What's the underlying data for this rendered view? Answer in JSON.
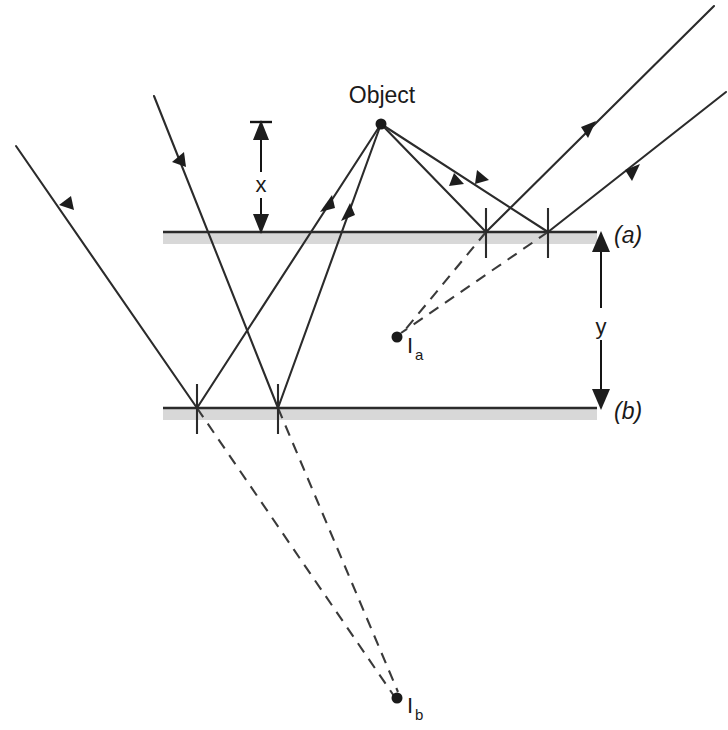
{
  "figure": {
    "title_label": "Object",
    "background_color": "#ffffff",
    "ray_color": "#2b2b2b",
    "virtual_ray_color": "#3a3a3a",
    "mirror_color": "#2b2b2b",
    "mirror_shade_color": "#c9c9c9"
  },
  "labels": {
    "object": "Object",
    "distance_x": "x",
    "distance_y": "y",
    "mirror_a": "(a)",
    "mirror_b": "(b)",
    "image_a_main": "I",
    "image_a_sub": "a",
    "image_b_main": "I",
    "image_b_sub": "b"
  },
  "points": {
    "object": {
      "x": 381,
      "y": 124,
      "label": "Object"
    },
    "image_a": {
      "x": 397,
      "y": 337,
      "label": "Ia"
    },
    "image_b": {
      "x": 397,
      "y": 698,
      "label": "Ib"
    }
  },
  "mirrors": [
    {
      "id": "a",
      "label": "(a)",
      "y": 232,
      "x_start": 163,
      "x_end": 597
    },
    {
      "id": "b",
      "label": "(b)",
      "y": 408,
      "x_start": 163,
      "x_end": 597
    }
  ],
  "reflection_points": [
    {
      "mirror": "a",
      "x": 486,
      "y": 232
    },
    {
      "mirror": "a",
      "x": 548,
      "y": 232
    },
    {
      "mirror": "b",
      "x": 197,
      "y": 408
    },
    {
      "mirror": "b",
      "x": 278,
      "y": 408
    }
  ],
  "dimensions": [
    {
      "id": "x",
      "label": "x",
      "orientation": "vertical",
      "axis_x": 261,
      "from_y": 124,
      "to_y": 232,
      "label_x": 261,
      "label_y": 186
    },
    {
      "id": "y",
      "label": "y",
      "orientation": "vertical",
      "axis_x": 601,
      "from_y": 233,
      "to_y": 408,
      "label_x": 601,
      "label_y": 327
    }
  ],
  "rays": {
    "incident_to_mirror_a": [
      {
        "from": [
          381,
          124
        ],
        "to": [
          486,
          232
        ],
        "arrow_at": [
          443,
          180
        ]
      },
      {
        "from": [
          381,
          124
        ],
        "to": [
          548,
          232
        ],
        "arrow_at": [
          472,
          177
        ]
      }
    ],
    "reflected_from_mirror_a": [
      {
        "from": [
          486,
          232
        ],
        "to": [
          712,
          8
        ],
        "arrow_at": [
          586,
          130
        ]
      },
      {
        "from": [
          548,
          232
        ],
        "to": [
          722,
          96
        ],
        "arrow_at": [
          632,
          170
        ]
      }
    ],
    "incident_to_mirror_b": [
      {
        "from": [
          381,
          124
        ],
        "to": [
          197,
          408
        ],
        "arrow_at": [
          327,
          206
        ]
      },
      {
        "from": [
          381,
          124
        ],
        "to": [
          278,
          408
        ],
        "arrow_at": [
          348,
          214
        ]
      }
    ],
    "reflected_from_mirror_b": [
      {
        "from": [
          197,
          408
        ],
        "to": [
          18,
          148
        ],
        "arrow_at": [
          66,
          212
        ]
      },
      {
        "from": [
          278,
          408
        ],
        "to": [
          155,
          98
        ],
        "arrow_at": [
          178,
          168
        ]
      }
    ],
    "virtual_to_image_a": [
      {
        "from": [
          486,
          232
        ],
        "to": [
          399,
          336
        ]
      },
      {
        "from": [
          548,
          232
        ],
        "to": [
          399,
          334
        ]
      }
    ],
    "virtual_to_image_b": [
      {
        "from": [
          197,
          408
        ],
        "to": [
          395,
          697
        ]
      },
      {
        "from": [
          278,
          408
        ],
        "to": [
          397,
          694
        ]
      }
    ]
  }
}
